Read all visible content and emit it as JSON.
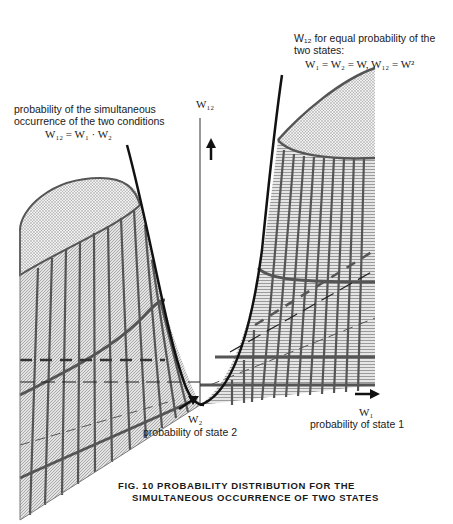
{
  "figure": {
    "caption_line1": "FIG. 10  PROBABILITY DISTRIBUTION FOR THE",
    "caption_line2": "SIMULTANEOUS OCCURRENCE OF TWO STATES"
  },
  "annotations": {
    "left_label_line1": "probability of the simultaneous",
    "left_label_line2": "occurrence of the two conditions",
    "left_formula": "W₁₂ = W₁ · W₂",
    "right_label_line1": "W₁₂ for equal probability of the",
    "right_label_line2": "two states:",
    "right_formula": "W₁ = W₂ = W, W₁₂ = W²"
  },
  "axes": {
    "vertical_label": "W₁₂",
    "x_label": "W₁",
    "x_description": "probability of state 1",
    "depth_label": "W₂",
    "depth_description": "probability of state 2"
  },
  "colors": {
    "surface_line": "#555555",
    "axis": "#111111",
    "hatch": "#9a9a9a",
    "stipple": "#bdbdbd"
  }
}
